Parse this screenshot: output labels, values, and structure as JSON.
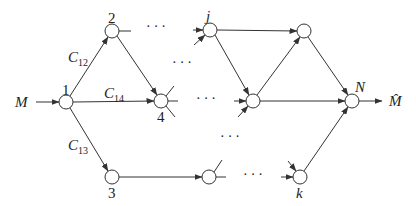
{
  "diagram": {
    "input_label": "M",
    "output_label": "M̂",
    "colors": {
      "stroke": "#333333",
      "node_fill": "#ffffff",
      "text": "#222222"
    },
    "nodes": [
      {
        "id": "1",
        "label": "1",
        "x": 66,
        "y": 102
      },
      {
        "id": "2",
        "label": "2",
        "x": 112,
        "y": 31
      },
      {
        "id": "j",
        "label": "j",
        "x": 210,
        "y": 30
      },
      {
        "id": "tr",
        "label": "",
        "x": 304,
        "y": 31
      },
      {
        "id": "4",
        "label": "4",
        "x": 161,
        "y": 101
      },
      {
        "id": "mid",
        "label": "",
        "x": 253,
        "y": 101
      },
      {
        "id": "N",
        "label": "N",
        "x": 352,
        "y": 101
      },
      {
        "id": "3",
        "label": "3",
        "x": 112,
        "y": 177
      },
      {
        "id": "lm",
        "label": "",
        "x": 209,
        "y": 177
      },
      {
        "id": "k",
        "label": "k",
        "x": 300,
        "y": 177
      }
    ],
    "edge_labels": [
      {
        "id": "c12",
        "main": "C",
        "sub": "12"
      },
      {
        "id": "c14",
        "main": "C",
        "sub": "14"
      },
      {
        "id": "c13",
        "main": "C",
        "sub": "13"
      }
    ],
    "ellipsis": "···"
  }
}
